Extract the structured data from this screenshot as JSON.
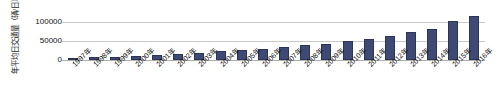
{
  "chart_data": {
    "type": "bar",
    "title": "",
    "subtitle": "",
    "xlabel": "",
    "ylabel": "年平均日交通量（辆/日）",
    "ylabel_main": "年平均日交通量",
    "ylabel_unit": "（辆/日）",
    "ylim": [
      0,
      125000
    ],
    "ytick_labels": [
      "100000",
      "50000",
      "0"
    ],
    "ytick_values": [
      100000,
      50000,
      0
    ],
    "grid": true,
    "legend": "none",
    "bar_color": "#3e4a73",
    "gridline_color": "#c9c9c9",
    "categories": [
      "1997年",
      "1998年",
      "1999年",
      "2000年",
      "2001年",
      "2002年",
      "2003年",
      "2004年",
      "2005年",
      "2006年",
      "2007年",
      "2008年",
      "2009年",
      "2010年",
      "2011年",
      "2012年",
      "2013年",
      "2014年",
      "2015年",
      "2016年"
    ],
    "values": [
      2500,
      2900,
      3500,
      4200,
      5200,
      6000,
      7500,
      9000,
      10500,
      11500,
      13000,
      15500,
      16500,
      19500,
      22000,
      25000,
      29000,
      31500,
      40000,
      45000
    ]
  }
}
